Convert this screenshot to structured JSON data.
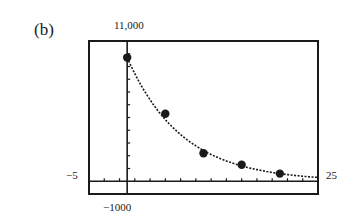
{
  "panel_label": "(b)",
  "window": {
    "xmin_label": "−5",
    "xmax_label": "25",
    "ymin_label": "−1000",
    "ymax_label": "11,000"
  },
  "chart_data": {
    "type": "scatter",
    "title": "",
    "panel": "(b)",
    "xlabel": "",
    "ylabel": "",
    "xlim": [
      -5,
      25
    ],
    "ylim": [
      -1000,
      11000
    ],
    "x_tick_spacing": 2,
    "y_tick_spacing": 1000,
    "grid": false,
    "legend": null,
    "series": [
      {
        "name": "data points",
        "style": "filled-circle",
        "x": [
          0,
          5,
          10,
          15,
          20
        ],
        "y": [
          9700,
          5300,
          2200,
          1300,
          600
        ]
      },
      {
        "name": "exponential decay fit",
        "style": "dotted-curve",
        "description": "Decreasing exponential curve passing near all data points, approaching 0 as x increases to 25"
      }
    ]
  }
}
